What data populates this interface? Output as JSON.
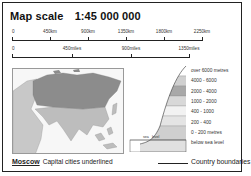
{
  "title": {
    "label": "Map scale",
    "ratio": "1:45 000 000"
  },
  "km_scale": {
    "ticks": [
      {
        "label": "0",
        "pos": 0
      },
      {
        "label": "450km",
        "pos": 38
      },
      {
        "label": "900km",
        "pos": 76
      },
      {
        "label": "1350km",
        "pos": 114
      },
      {
        "label": "1800km",
        "pos": 152
      },
      {
        "label": "2250km",
        "pos": 190
      }
    ]
  },
  "miles_scale": {
    "ticks": [
      {
        "label": "0",
        "pos": 0
      },
      {
        "label": "450miles",
        "pos": 60
      },
      {
        "label": "900miles",
        "pos": 119
      },
      {
        "label": "1350miles",
        "pos": 177
      }
    ]
  },
  "elevation_legend": {
    "bands": [
      {
        "label": "over 6000 metres",
        "color": "#ffffff"
      },
      {
        "label": "4000 - 6000",
        "color": "#d0d0d0"
      },
      {
        "label": "2000 - 4000",
        "color": "#a8a8a8"
      },
      {
        "label": "1000 - 2000",
        "color": "#d8d8d8"
      },
      {
        "label": "400 - 1000",
        "color": "#f2f2f2"
      },
      {
        "label": "200 - 400",
        "color": "#e4e4e4"
      },
      {
        "label": "0 - 200 metres",
        "color": "#cfcfcf"
      },
      {
        "label": "below sea level",
        "color": "#e0e0e0"
      }
    ],
    "sea_label": "sea",
    "level_label": "level"
  },
  "footer": {
    "capital_example": "Moscow",
    "capital_text": "Capital cities underlined",
    "boundary_text": "Country boundaries"
  },
  "colors": {
    "russia": "#8c8c8c",
    "asia": "#bdbdbd",
    "land_other": "#c8c8c8",
    "sea": "#f7f7f7"
  }
}
